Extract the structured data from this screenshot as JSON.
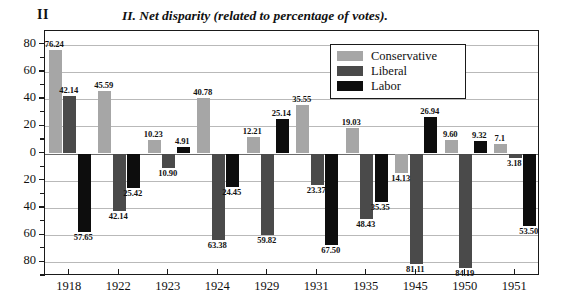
{
  "figure": {
    "number": "II",
    "title": "II. Net disparity (related to percentage of votes)."
  },
  "legend": {
    "position": "inside-top-right",
    "entries": [
      {
        "label": "Conservative",
        "color": "#a6a6a6",
        "swatch": "conservative-swatch"
      },
      {
        "label": "Liberal",
        "color": "#4a4a4a",
        "swatch": "liberal-swatch"
      },
      {
        "label": "Labor",
        "color": "#0d0d0d",
        "swatch": "labor-swatch"
      }
    ]
  },
  "axes": {
    "y_ticks": [
      "80",
      "60",
      "40",
      "20",
      "0",
      "20",
      "40",
      "60",
      "80"
    ],
    "y_tick_values": [
      80,
      60,
      40,
      20,
      0,
      -20,
      -40,
      -60,
      -80
    ],
    "ylim": [
      -90,
      90
    ],
    "x_ticks": [
      "1918",
      "1922",
      "1923",
      "1924",
      "1929",
      "1931",
      "1935",
      "1945",
      "1950",
      "1951"
    ]
  },
  "chart_data": {
    "type": "bar",
    "title": "II. Net disparity (related to percentage of votes).",
    "xlabel": "",
    "ylabel": "",
    "ylim": [
      -90,
      90
    ],
    "grid": true,
    "legend_position": "inside-top-right",
    "categories": [
      "1918",
      "1922",
      "1923",
      "1924",
      "1929",
      "1931",
      "1935",
      "1945",
      "1950",
      "1951"
    ],
    "series": [
      {
        "name": "Conservative",
        "color": "#a6a6a6",
        "values": [
          76.24,
          45.59,
          10.23,
          40.78,
          12.21,
          35.55,
          19.03,
          -14.13,
          9.6,
          7.1
        ],
        "labels": [
          "76.24",
          "45.59",
          "10.23",
          "40.78",
          "12.21",
          "35.55",
          "19.03",
          "14.13",
          "9.60",
          "7.1"
        ]
      },
      {
        "name": "Liberal",
        "color": "#4a4a4a",
        "values": [
          42.14,
          -42.14,
          -10.9,
          -63.38,
          -59.82,
          -23.37,
          -48.43,
          -81.11,
          -84.19,
          -3.18
        ],
        "labels": [
          "42.14",
          "42.14",
          "10.90",
          "63.38",
          "59.82",
          "23.37",
          "48.43",
          "81.11",
          "84.19",
          "3.18"
        ]
      },
      {
        "name": "Labor",
        "color": "#0d0d0d",
        "values": [
          -57.65,
          -25.42,
          4.91,
          -24.45,
          25.14,
          -67.5,
          -35.35,
          26.94,
          9.32,
          -53.5
        ],
        "labels": [
          "57.65",
          "25.42",
          "4.91",
          "24.45",
          "25.14",
          "67.50",
          "35.35",
          "26.94",
          "9.32",
          "53.50"
        ]
      }
    ]
  }
}
